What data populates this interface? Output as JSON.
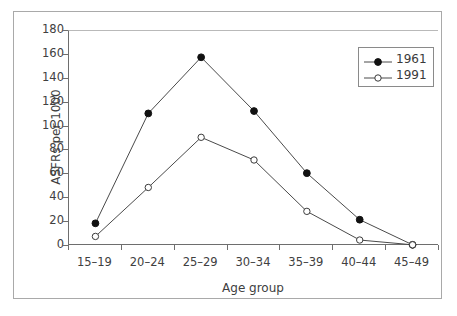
{
  "chart_data": {
    "type": "line",
    "title": "",
    "subtitle": "",
    "xlabel": "Age group",
    "ylabel": "ASFRs per 1000",
    "categories": [
      "15–19",
      "20–24",
      "25–29",
      "30–34",
      "35–39",
      "40–44",
      "45–49"
    ],
    "ylim": [
      0,
      180
    ],
    "yticks": [
      0,
      20,
      40,
      60,
      80,
      100,
      120,
      140,
      160,
      180
    ],
    "ytick_labels": [
      "0",
      "20",
      "40",
      "60",
      "80",
      "100",
      "120",
      "140",
      "160",
      "180"
    ],
    "grid": false,
    "legend_position": "top-right",
    "series": [
      {
        "name": "1961",
        "marker": "filled-circle",
        "color": "#000000",
        "values": [
          19,
          111,
          158,
          113,
          61,
          22,
          1
        ]
      },
      {
        "name": "1991",
        "marker": "open-circle",
        "color": "#000000",
        "values": [
          8,
          49,
          91,
          72,
          29,
          5,
          1
        ]
      }
    ]
  },
  "legend": {
    "items": [
      {
        "label": "1961",
        "marker": "filled-circle"
      },
      {
        "label": "1991",
        "marker": "open-circle"
      }
    ]
  },
  "colors": {
    "frame": "#a9a9a9",
    "axis": "#6e6e6e",
    "line": "#4a4a4a",
    "text": "#404040",
    "background": "#ffffff"
  }
}
